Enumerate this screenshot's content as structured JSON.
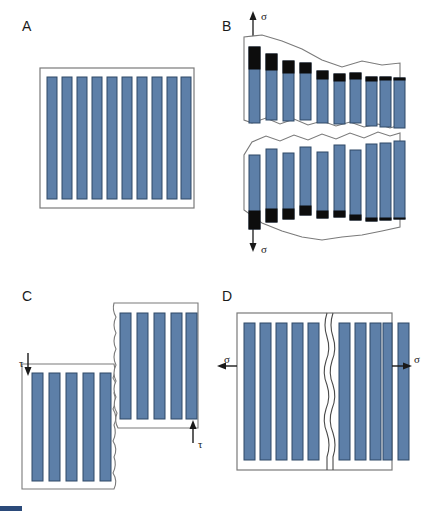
{
  "figure": {
    "colors": {
      "fiber_fill": "#5d7fa8",
      "fiber_edge": "#2f4966",
      "pullout_black": "#0d0d0d",
      "matrix_outline": "#6b6b6b",
      "text": "#1a1a1a",
      "background": "#ffffff"
    }
  },
  "panels": [
    {
      "id": "A",
      "letter": "A",
      "name": "intact-composite",
      "fiber_count": 10,
      "labels": []
    },
    {
      "id": "B",
      "letter": "B",
      "name": "tensile-fracture-fiber-pullout",
      "fiber_count": 10,
      "labels": [
        {
          "symbol": "σ",
          "name": "sigma-top",
          "direction": "up"
        },
        {
          "symbol": "σ",
          "name": "sigma-bottom",
          "direction": "down"
        }
      ],
      "pullout_lengths_top": [
        22,
        16,
        12,
        10,
        8,
        7,
        6,
        4,
        3,
        2
      ],
      "pullout_lengths_bottom": [
        18,
        13,
        10,
        9,
        7,
        6,
        5,
        3,
        2,
        1
      ]
    },
    {
      "id": "C",
      "letter": "C",
      "name": "shear-fracture-offset",
      "fiber_count_left": 5,
      "fiber_count_right": 5,
      "labels": [
        {
          "symbol": "τ",
          "name": "tau-left",
          "direction": "down"
        },
        {
          "symbol": "τ",
          "name": "tau-right",
          "direction": "up"
        }
      ]
    },
    {
      "id": "D",
      "letter": "D",
      "name": "transverse-matrix-crack",
      "fiber_count_left": 5,
      "fiber_count_right": 5,
      "labels": [
        {
          "symbol": "σ",
          "name": "sigma-left",
          "direction": "left"
        },
        {
          "symbol": "σ",
          "name": "sigma-right",
          "direction": "right"
        }
      ]
    }
  ]
}
